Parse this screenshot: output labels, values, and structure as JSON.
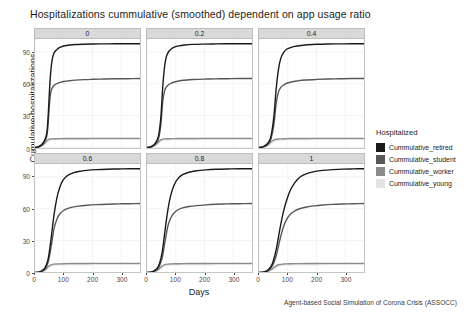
{
  "chart_data": {
    "type": "line",
    "title": "Hospitalizations cummulative (smoothed) dependent on app usage ratio",
    "xlabel": "Days",
    "ylabel": "Cumulative hospitalizations",
    "caption": "Agent-based Social Simulation of Corona Crisis (ASSOCC)",
    "grid": true,
    "legend_position": "right",
    "legend_title": "Hospitalized",
    "xlim": [
      0,
      365
    ],
    "ylim": [
      0,
      102
    ],
    "xticks": [
      0,
      100,
      200,
      300
    ],
    "xtick_labels": [
      "0",
      "100",
      "200",
      "300"
    ],
    "yticks": [
      0,
      30,
      60,
      90
    ],
    "ytick_labels": [
      "0",
      "30",
      "60",
      "90"
    ],
    "facet_variable": "app usage ratio",
    "facets": [
      {
        "label": "0",
        "x": [
          0,
          10,
          20,
          30,
          40,
          45,
          50,
          55,
          60,
          65,
          70,
          80,
          90,
          100,
          120,
          140,
          170,
          200,
          240,
          280,
          320,
          365
        ],
        "series": [
          {
            "name": "Cummulative_retired",
            "values": [
              0,
              0.5,
              2,
              5,
              12,
              26,
              52,
              72,
              83,
              88,
              90.5,
              93,
              94.5,
              95.4,
              96.3,
              96.8,
              97.1,
              97.3,
              97.4,
              97.5,
              97.5,
              97.6
            ]
          },
          {
            "name": "Cummulative_student",
            "values": [
              0,
              0.4,
              1.6,
              4,
              9.5,
              20,
              40,
              52,
              56,
              58,
              59.2,
              60.5,
              61.4,
              62,
              62.8,
              63.3,
              63.8,
              64.1,
              64.4,
              64.6,
              64.7,
              64.8
            ]
          },
          {
            "name": "Cummulative_worker",
            "values": [
              0,
              0.3,
              1.2,
              3,
              6,
              7.2,
              7.8,
              8.0,
              8.1,
              8.2,
              8.25,
              8.3,
              8.35,
              8.4,
              8.45,
              8.5,
              8.5,
              8.55,
              8.55,
              8.6,
              8.6,
              8.6
            ]
          },
          {
            "name": "Cummulative_young",
            "values": [
              0,
              0.2,
              0.8,
              2,
              4.5,
              6.0,
              6.8,
              7.1,
              7.2,
              7.3,
              7.35,
              7.4,
              7.45,
              7.5,
              7.5,
              7.55,
              7.55,
              7.6,
              7.6,
              7.6,
              7.65,
              7.65
            ]
          }
        ]
      },
      {
        "label": "0.2",
        "x": [
          0,
          10,
          20,
          30,
          40,
          48,
          55,
          62,
          68,
          75,
          85,
          95,
          110,
          130,
          160,
          200,
          240,
          280,
          320,
          365
        ],
        "series": [
          {
            "name": "Cummulative_retired",
            "values": [
              0,
              0.4,
              1.8,
              4.5,
              11,
              28,
              58,
              78,
              86,
              90,
              92.8,
              94.3,
              95.5,
              96.3,
              96.9,
              97.2,
              97.4,
              97.5,
              97.5,
              97.6
            ]
          },
          {
            "name": "Cummulative_student",
            "values": [
              0,
              0.3,
              1.4,
              3.6,
              8.5,
              21,
              44,
              54,
              57,
              59,
              60.6,
              61.6,
              62.5,
              63.2,
              63.9,
              64.3,
              64.5,
              64.7,
              64.8,
              64.9
            ]
          },
          {
            "name": "Cummulative_worker",
            "values": [
              0,
              0.25,
              1.0,
              2.6,
              5.5,
              7.2,
              7.9,
              8.1,
              8.2,
              8.25,
              8.3,
              8.35,
              8.4,
              8.45,
              8.5,
              8.55,
              8.55,
              8.6,
              8.6,
              8.6
            ]
          },
          {
            "name": "Cummulative_young",
            "values": [
              0,
              0.15,
              0.7,
              1.8,
              4.2,
              6.2,
              6.9,
              7.15,
              7.25,
              7.3,
              7.4,
              7.45,
              7.5,
              7.5,
              7.55,
              7.6,
              7.6,
              7.6,
              7.65,
              7.65
            ]
          }
        ]
      },
      {
        "label": "0.4",
        "x": [
          0,
          10,
          20,
          32,
          42,
          52,
          60,
          68,
          76,
          86,
          96,
          112,
          132,
          160,
          200,
          240,
          280,
          320,
          365
        ],
        "series": [
          {
            "name": "Cummulative_retired",
            "values": [
              0,
              0.4,
              1.6,
              4.5,
              11,
              30,
              56,
              74,
              84,
              89.5,
              92.4,
              94.2,
              95.4,
              96.4,
              97.0,
              97.3,
              97.4,
              97.5,
              97.6
            ]
          },
          {
            "name": "Cummulative_student",
            "values": [
              0,
              0.3,
              1.3,
              3.5,
              8.5,
              22,
              42,
              52.5,
              56.5,
              58.8,
              60.4,
              61.6,
              62.5,
              63.4,
              64.0,
              64.4,
              64.6,
              64.8,
              64.9
            ]
          },
          {
            "name": "Cummulative_worker",
            "values": [
              0,
              0.22,
              0.95,
              2.6,
              5.4,
              7.1,
              7.8,
              8.05,
              8.15,
              8.25,
              8.3,
              8.4,
              8.45,
              8.5,
              8.55,
              8.55,
              8.6,
              8.6,
              8.6
            ]
          },
          {
            "name": "Cummulative_young",
            "values": [
              0,
              0.14,
              0.65,
              1.8,
              4.0,
              6.0,
              6.85,
              7.1,
              7.2,
              7.32,
              7.4,
              7.45,
              7.5,
              7.55,
              7.6,
              7.6,
              7.62,
              7.65,
              7.65
            ]
          }
        ]
      },
      {
        "label": "0.6",
        "x": [
          0,
          12,
          24,
          36,
          46,
          56,
          66,
          76,
          86,
          98,
          112,
          130,
          152,
          180,
          215,
          250,
          290,
          330,
          365
        ],
        "series": [
          {
            "name": "Cummulative_retired",
            "values": [
              0,
              0.4,
              1.6,
              5,
              13,
              32,
              54,
              70,
              80,
              87,
              91,
              93.5,
              95,
              96,
              96.7,
              97.1,
              97.3,
              97.5,
              97.6
            ]
          },
          {
            "name": "Cummulative_student",
            "values": [
              0,
              0.3,
              1.3,
              3.8,
              10,
              24,
              41,
              50,
              55,
              58,
              60,
              61.4,
              62.4,
              63.2,
              63.8,
              64.2,
              64.5,
              64.7,
              64.9
            ]
          },
          {
            "name": "Cummulative_worker",
            "values": [
              0,
              0.2,
              0.9,
              2.7,
              5.6,
              7.2,
              7.85,
              8.05,
              8.15,
              8.25,
              8.32,
              8.4,
              8.45,
              8.5,
              8.55,
              8.55,
              8.6,
              8.6,
              8.6
            ]
          },
          {
            "name": "Cummulative_young",
            "values": [
              0,
              0.13,
              0.6,
              1.9,
              4.2,
              6.1,
              6.9,
              7.12,
              7.22,
              7.32,
              7.4,
              7.46,
              7.5,
              7.55,
              7.6,
              7.6,
              7.62,
              7.65,
              7.65
            ]
          }
        ]
      },
      {
        "label": "0.8",
        "x": [
          0,
          12,
          26,
          40,
          52,
          62,
          72,
          82,
          94,
          108,
          124,
          146,
          172,
          205,
          240,
          280,
          320,
          365
        ],
        "series": [
          {
            "name": "Cummulative_retired",
            "values": [
              0,
              0.4,
              1.8,
              6,
              18,
              38,
              58,
              72,
              82,
              88.5,
              92,
              94.2,
              95.6,
              96.5,
              97.0,
              97.3,
              97.5,
              97.6
            ]
          },
          {
            "name": "Cummulative_student",
            "values": [
              0,
              0.3,
              1.4,
              4.5,
              13,
              28,
              43,
              51,
              56,
              59,
              60.8,
              62,
              62.9,
              63.6,
              64.1,
              64.5,
              64.7,
              64.9
            ]
          },
          {
            "name": "Cummulative_worker",
            "values": [
              0,
              0.2,
              0.95,
              3.0,
              6.0,
              7.4,
              7.9,
              8.08,
              8.2,
              8.28,
              8.35,
              8.42,
              8.48,
              8.52,
              8.56,
              8.58,
              8.6,
              8.6
            ]
          },
          {
            "name": "Cummulative_young",
            "values": [
              0,
              0.13,
              0.65,
              2.1,
              4.6,
              6.3,
              6.95,
              7.15,
              7.26,
              7.35,
              7.42,
              7.48,
              7.52,
              7.56,
              7.6,
              7.62,
              7.65,
              7.65
            ]
          }
        ]
      },
      {
        "label": "1",
        "x": [
          0,
          14,
          30,
          46,
          60,
          72,
          84,
          96,
          110,
          126,
          144,
          166,
          192,
          222,
          255,
          292,
          330,
          365
        ],
        "series": [
          {
            "name": "Cummulative_retired",
            "values": [
              0,
              0.4,
              2.0,
              8,
              22,
              40,
              56,
              68,
              78,
              85,
              90,
              93,
              94.8,
              96,
              96.7,
              97.2,
              97.4,
              97.6
            ]
          },
          {
            "name": "Cummulative_student",
            "values": [
              0,
              0.3,
              1.5,
              6,
              16,
              30,
              42,
              50,
              55,
              58.2,
              60.2,
              61.6,
              62.6,
              63.4,
              64.0,
              64.4,
              64.7,
              64.9
            ]
          },
          {
            "name": "Cummulative_worker",
            "values": [
              0,
              0.2,
              1.0,
              3.4,
              6.3,
              7.5,
              7.95,
              8.12,
              8.22,
              8.3,
              8.38,
              8.44,
              8.5,
              8.54,
              8.57,
              8.59,
              8.6,
              8.6
            ]
          },
          {
            "name": "Cummulative_young",
            "values": [
              0,
              0.13,
              0.7,
              2.4,
              4.9,
              6.4,
              7.0,
              7.18,
              7.3,
              7.38,
              7.44,
              7.5,
              7.54,
              7.58,
              7.61,
              7.63,
              7.65,
              7.65
            ]
          }
        ]
      }
    ],
    "series_colors": {
      "Cummulative_retired": "#1a1a1a",
      "Cummulative_student": "#575757",
      "Cummulative_worker": "#8c8c8c",
      "Cummulative_young": "#e3e3e3"
    }
  },
  "legend": {
    "title": "Hospitalized",
    "items": [
      {
        "label": "Cummulative_retired",
        "color": "#1a1a1a"
      },
      {
        "label": "Cummulative_student",
        "color": "#575757"
      },
      {
        "label": "Cummulative_worker",
        "color": "#8c8c8c"
      },
      {
        "label": "Cummulative_young",
        "color": "#e3e3e3"
      }
    ]
  }
}
